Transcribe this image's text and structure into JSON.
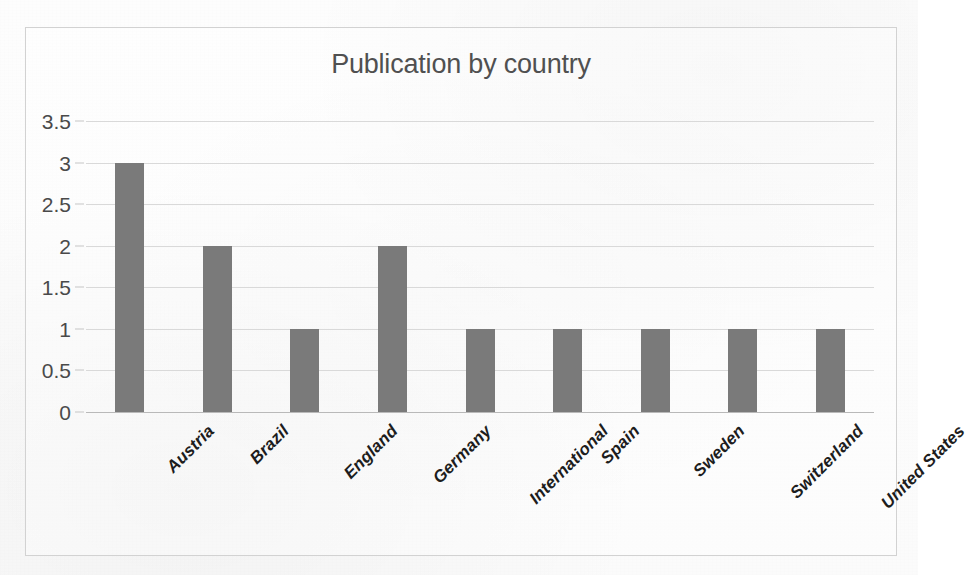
{
  "chart_data": {
    "type": "bar",
    "title": "Publication by country",
    "xlabel": "",
    "ylabel": "",
    "categories": [
      "Austria",
      "Brazil",
      "England",
      "Germany",
      "International",
      "Spain",
      "Sweden",
      "Switzerland",
      "United States"
    ],
    "values": [
      3,
      2,
      1,
      2,
      1,
      1,
      1,
      1,
      1
    ],
    "ylim": [
      0,
      3.5
    ],
    "ytick_labels": [
      "0",
      "0.5",
      "1",
      "1.5",
      "2",
      "2.5",
      "3",
      "3.5"
    ],
    "ytick_values": [
      0,
      0.5,
      1,
      1.5,
      2,
      2.5,
      3,
      3.5
    ],
    "grid": true,
    "legend": false,
    "legend_position": "none",
    "series": [
      {
        "name": "Publications",
        "values": [
          3,
          2,
          1,
          2,
          1,
          1,
          1,
          1,
          1
        ]
      }
    ],
    "colors": {
      "bar": "#7a7a7a",
      "title": "#505050",
      "gridline": "#d9d9d9",
      "axis": "#b9b9b9",
      "frame": "#d2d2d2",
      "background": "#fdfdfd",
      "tick_label": "#4a4a4a",
      "category_label": "#1d1d1d"
    },
    "annotations": []
  }
}
